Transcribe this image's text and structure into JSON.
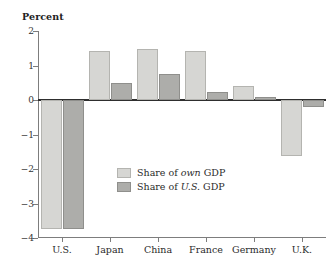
{
  "chart_data": {
    "type": "bar",
    "title": "",
    "xlabel": "",
    "ylabel": "Percent",
    "ylim": [
      -4,
      2
    ],
    "yticks": [
      2,
      1,
      0,
      -1,
      -2,
      -3,
      -4
    ],
    "ytick_labels": [
      "2",
      "1",
      "0",
      "−1",
      "−2",
      "−3",
      "−4"
    ],
    "grid": false,
    "legend_position": "center",
    "categories": [
      "U.S.",
      "Japan",
      "China",
      "France",
      "Germany",
      "U.K."
    ],
    "series": [
      {
        "name": "Share of own GDP",
        "color": "#d6d6d3",
        "values": [
          -3.75,
          1.42,
          1.49,
          1.43,
          0.42,
          -1.63
        ]
      },
      {
        "name": "Share of U.S. GDP",
        "color": "#adadaa",
        "values": [
          -3.74,
          0.49,
          0.75,
          0.22,
          0.1,
          -0.2
        ]
      }
    ]
  },
  "legend": {
    "items": [
      {
        "prefix": "Share of ",
        "emphasis": "own",
        "suffix": " GDP",
        "swatch": "own"
      },
      {
        "prefix": "Share of ",
        "emphasis": "U.S.",
        "suffix": " GDP",
        "swatch": "us"
      }
    ]
  }
}
